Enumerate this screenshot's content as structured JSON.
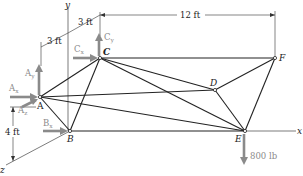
{
  "diagram": {
    "type": "space truss",
    "nodes": {
      "A": {
        "label": "A"
      },
      "B": {
        "label": "B"
      },
      "C": {
        "label": "C"
      },
      "D": {
        "label": "D"
      },
      "E": {
        "label": "E"
      },
      "F": {
        "label": "F"
      }
    },
    "axes": {
      "x": "x",
      "y": "y",
      "z": "z"
    },
    "dimensions": {
      "dim_3ft_a": "3 ft",
      "dim_3ft_b": "3 ft",
      "dim_12ft": "12 ft",
      "dim_4ft": "4 ft"
    },
    "reactions": {
      "Ay": {
        "main": "A",
        "sub": "y"
      },
      "Ax": {
        "main": "A",
        "sub": "x"
      },
      "Az": {
        "main": "A",
        "sub": "z"
      },
      "Bx": {
        "main": "B",
        "sub": "x"
      },
      "Cx": {
        "main": "C",
        "sub": "x"
      },
      "Cy": {
        "main": "C",
        "sub": "y"
      }
    },
    "load": {
      "label": "800 lb",
      "node": "E"
    },
    "members": [
      "AB",
      "AC",
      "AD",
      "AE",
      "BC",
      "BE",
      "CD",
      "CE",
      "CF",
      "DE",
      "DF",
      "EF"
    ],
    "colors": {
      "member": "#222222",
      "force": "#8a8a8a"
    }
  }
}
